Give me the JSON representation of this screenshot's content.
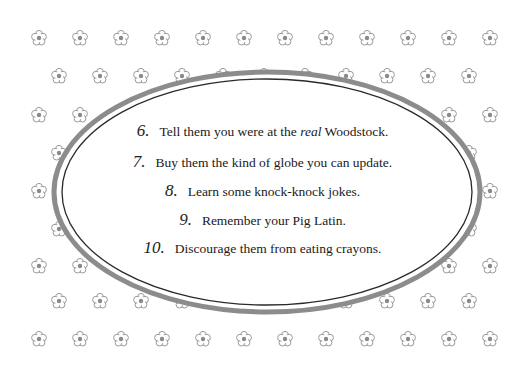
{
  "card": {
    "background": "#ffffff",
    "pattern_color": "#9a9a9a",
    "outer_ring_color": "#8c8c8c",
    "inner_ring_color": "#2a2a2a"
  },
  "pattern": {
    "icon": "flower-icon",
    "rows_a_y": [
      38,
      115,
      191,
      266,
      339
    ],
    "rows_b_y": [
      76,
      153,
      229,
      301
    ],
    "row_a_x_start": 39,
    "row_b_x_start": 59,
    "spacing": 41,
    "row_a_count": 12,
    "row_b_count": 11
  },
  "list": {
    "items": [
      {
        "number": "6.",
        "text_before": "Tell them you were at the ",
        "emphasis": "real",
        "text_after": " Woodstock.",
        "y": 121
      },
      {
        "number": "7.",
        "text_before": "Buy them the kind of globe you can update.",
        "emphasis": "",
        "text_after": "",
        "y": 152
      },
      {
        "number": "8.",
        "text_before": "Learn some knock-knock jokes.",
        "emphasis": "",
        "text_after": "",
        "y": 181
      },
      {
        "number": "9.",
        "text_before": "Remember your Pig Latin.",
        "emphasis": "",
        "text_after": "",
        "y": 210
      },
      {
        "number": "10.",
        "text_before": "Discourage them from eating crayons.",
        "emphasis": "",
        "text_after": "",
        "y": 238
      }
    ]
  }
}
